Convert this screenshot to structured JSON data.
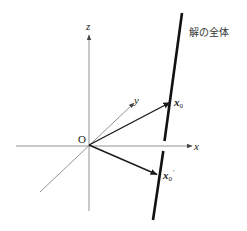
{
  "diagram": {
    "title_label": "解の全体",
    "origin_label": "O",
    "axes": {
      "x_label": "x",
      "y_label": "y",
      "z_label": "z"
    },
    "vectors": [
      {
        "name": "x0",
        "label_main": "x",
        "label_sub": "0",
        "label_prime": ""
      },
      {
        "name": "x0-prime",
        "label_main": "x",
        "label_sub": "0",
        "label_prime": "′"
      }
    ],
    "colors": {
      "axis": "#777777",
      "vector": "#1a1a1a",
      "solution_line": "#111111",
      "background": "#ffffff"
    }
  }
}
